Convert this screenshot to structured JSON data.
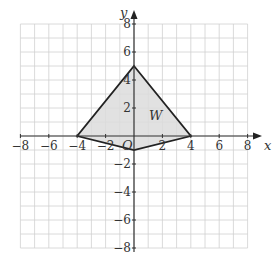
{
  "diagram": {
    "x_axis_label": "x",
    "y_axis_label": "y",
    "origin_label": "O",
    "shape_label": "W",
    "x_ticks": [
      "−8",
      "−6",
      "−4",
      "−2",
      "2",
      "4",
      "6",
      "8"
    ],
    "y_ticks": [
      "8",
      "6",
      "4",
      "2",
      "−2",
      "−4",
      "−6",
      "−8"
    ],
    "range": {
      "xmin": -8,
      "xmax": 8,
      "ymin": -8,
      "ymax": 8
    },
    "vertices": [
      [
        0,
        5
      ],
      [
        4,
        0
      ],
      [
        0,
        -1
      ],
      [
        -4,
        0
      ]
    ],
    "colors": {
      "grid": "#d0d0d0",
      "axis": "#333333",
      "fill": "#dcdcdc",
      "edge": "#222222"
    }
  }
}
